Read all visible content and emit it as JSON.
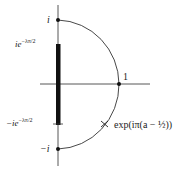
{
  "diagram": {
    "labels": {
      "top": "i",
      "upper_bar": "ie",
      "upper_bar_exp": "−λπ/2",
      "one": "1",
      "lower_bar_prefix": "−ie",
      "lower_bar_exp": "−λπ/2",
      "bottom": "−i",
      "arc_point": "exp(iπ(a − ½))"
    },
    "colors": {
      "line": "#333333",
      "bar": "#111111",
      "text": "#222222"
    }
  }
}
